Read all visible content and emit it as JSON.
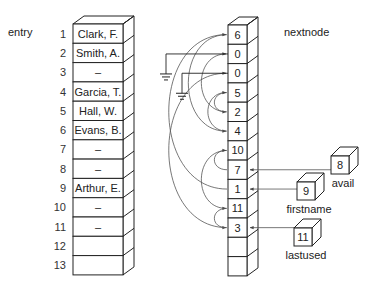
{
  "labels": {
    "entry": "entry",
    "nextnode": "nextnode"
  },
  "entry_rows": [
    {
      "index": "1",
      "value": "Clark, F."
    },
    {
      "index": "2",
      "value": "Smith, A."
    },
    {
      "index": "3",
      "value": "–"
    },
    {
      "index": "4",
      "value": "Garcia, T."
    },
    {
      "index": "5",
      "value": "Hall, W."
    },
    {
      "index": "6",
      "value": "Evans, B."
    },
    {
      "index": "7",
      "value": "–"
    },
    {
      "index": "8",
      "value": "–"
    },
    {
      "index": "9",
      "value": "Arthur, E."
    },
    {
      "index": "10",
      "value": "–"
    },
    {
      "index": "11",
      "value": "–"
    },
    {
      "index": "12",
      "value": ""
    },
    {
      "index": "13",
      "value": ""
    }
  ],
  "nextnode_rows": [
    "6",
    "0",
    "0",
    "5",
    "2",
    "4",
    "10",
    "7",
    "1",
    "11",
    "3",
    "",
    ""
  ],
  "pointers": [
    {
      "name": "avail",
      "value": "8",
      "points_to_row": 8
    },
    {
      "name": "firstname",
      "value": "9",
      "points_to_row": 9
    },
    {
      "name": "lastused",
      "value": "11",
      "points_to_row": 11
    }
  ],
  "ground_rows": [
    2,
    3
  ],
  "links": [
    {
      "from": 1,
      "to": 6
    },
    {
      "from": 4,
      "to": 5
    },
    {
      "from": 5,
      "to": 2
    },
    {
      "from": 6,
      "to": 4
    },
    {
      "from": 7,
      "to": 10
    },
    {
      "from": 8,
      "to": 7
    },
    {
      "from": 9,
      "to": 1
    },
    {
      "from": 10,
      "to": 11
    },
    {
      "from": 11,
      "to": 3
    }
  ]
}
